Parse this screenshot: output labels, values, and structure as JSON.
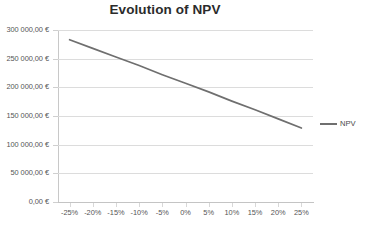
{
  "chart_data": {
    "type": "line",
    "title": "Evolution of NPV",
    "xlabel": "",
    "ylabel": "",
    "grid": true,
    "legend_position": "right",
    "categories": [
      "-25%",
      "-20%",
      "-15%",
      "-10%",
      "-5%",
      "0%",
      "5%",
      "10%",
      "15%",
      "20%",
      "25%"
    ],
    "x": [
      -25,
      -20,
      -15,
      -10,
      -5,
      0,
      5,
      10,
      15,
      20,
      25
    ],
    "xlim": [
      -27.5,
      27.5
    ],
    "ylim": [
      0,
      300000
    ],
    "yticks": [
      0,
      50000,
      100000,
      150000,
      200000,
      250000,
      300000
    ],
    "ytick_labels": [
      "0,00 €",
      "50 000,00 €",
      "100 000,00 €",
      "150 000,00 €",
      "200 000,00 €",
      "250 000,00 €",
      "300 000,00 €"
    ],
    "series": [
      {
        "name": "NPV",
        "color": "#6f6f6f",
        "values": [
          283000,
          268000,
          253000,
          238000,
          222000,
          207000,
          192000,
          176000,
          161000,
          145000,
          129000
        ]
      }
    ]
  },
  "legend": {
    "items": [
      {
        "label": "NPV",
        "color": "#6f6f6f"
      }
    ]
  }
}
